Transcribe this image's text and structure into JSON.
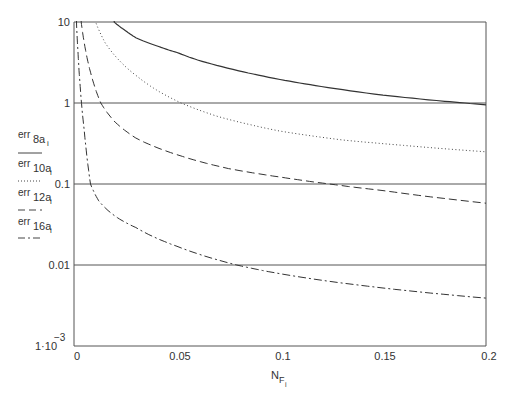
{
  "chart_data": {
    "type": "line",
    "title": "",
    "xlabel": "N_Fi",
    "xlabel_main": "N",
    "xlabel_sub": "F",
    "xlabel_subsub": "i",
    "ylabel": "err_8a_i, err_10a_i, err_12a_i, err_16a_i",
    "yscale": "log",
    "xlim": [
      0,
      0.2
    ],
    "ylim": [
      0.001,
      10
    ],
    "grid": "horizontal at 1, 0.1, 0.01",
    "x_ticks": [
      "0",
      "0.05",
      "0.1",
      "0.15",
      "0.2"
    ],
    "x_tick_values": [
      0,
      0.05,
      0.1,
      0.15,
      0.2
    ],
    "y_ticks": [
      {
        "value": 10,
        "label": "10"
      },
      {
        "value": 1,
        "label": "1"
      },
      {
        "value": 0.1,
        "label": "0.1"
      },
      {
        "value": 0.01,
        "label": "0.01"
      },
      {
        "value": 0.001,
        "label": "1·10",
        "exp": "−3"
      }
    ],
    "legend_position": "left of plot",
    "series": [
      {
        "name": "err_8a_i",
        "label_main": "err",
        "label_sub": "8a",
        "label_subsub": "i",
        "style": "solid",
        "x": [
          0.0195,
          0.025,
          0.03,
          0.04,
          0.05,
          0.06,
          0.08,
          0.1,
          0.12,
          0.15,
          0.18,
          0.2
        ],
        "values": [
          10,
          7.8,
          6.4,
          5.1,
          4.2,
          3.4,
          2.5,
          1.95,
          1.6,
          1.25,
          1.05,
          0.95
        ]
      },
      {
        "name": "err_10a_i",
        "label_main": "err",
        "label_sub": "10a",
        "label_subsub": "i",
        "style": "dotted",
        "x": [
          0.0105,
          0.015,
          0.02,
          0.03,
          0.04,
          0.052,
          0.07,
          0.1,
          0.13,
          0.16,
          0.2
        ],
        "values": [
          10,
          5.6,
          3.8,
          2.2,
          1.45,
          1.0,
          0.68,
          0.45,
          0.35,
          0.3,
          0.25
        ]
      },
      {
        "name": "err_12a_i",
        "label_main": "err",
        "label_sub": "12a",
        "label_subsub": "i",
        "style": "dashed",
        "x": [
          0.0035,
          0.005,
          0.008,
          0.013,
          0.02,
          0.03,
          0.05,
          0.075,
          0.1,
          0.124,
          0.15,
          0.2
        ],
        "values": [
          10,
          5.5,
          2.4,
          1.0,
          0.58,
          0.37,
          0.23,
          0.155,
          0.122,
          0.1,
          0.083,
          0.058
        ]
      },
      {
        "name": "err_16a_i",
        "label_main": "err",
        "label_sub": "16a",
        "label_subsub": "i",
        "style": "dashdot",
        "x": [
          0.0012,
          0.002,
          0.003,
          0.005,
          0.008,
          0.012,
          0.02,
          0.03,
          0.05,
          0.079,
          0.1,
          0.15,
          0.2
        ],
        "values": [
          10,
          4.0,
          1.6,
          0.45,
          0.1,
          0.062,
          0.04,
          0.029,
          0.017,
          0.01,
          0.0078,
          0.0052,
          0.0039
        ]
      }
    ]
  }
}
